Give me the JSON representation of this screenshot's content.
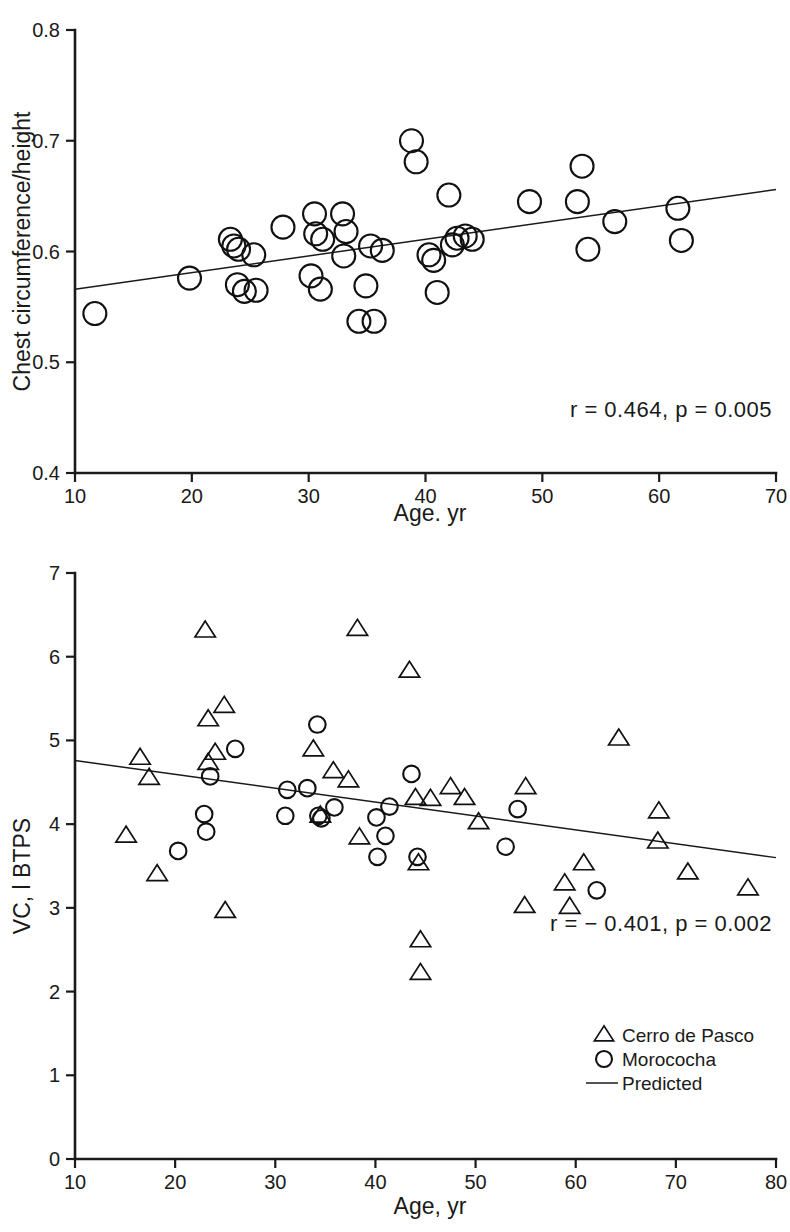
{
  "figure": {
    "background": "#ffffff",
    "ink_color": "#1a1a1a"
  },
  "chart_data": [
    {
      "id": "chest-circumference-vs-age",
      "type": "scatter",
      "title": "",
      "xlabel": "Age. yr",
      "ylabel": "Chest circumference/height",
      "xlim": [
        10,
        70
      ],
      "ylim": [
        0.4,
        0.8
      ],
      "xticks": [
        10,
        20,
        30,
        40,
        50,
        60,
        70
      ],
      "xtick_labels": [
        "10",
        "20",
        "30",
        "40",
        "50",
        "60",
        "70"
      ],
      "yticks": [
        0.4,
        0.5,
        0.6,
        0.7,
        0.8
      ],
      "ytick_labels": [
        "0.4",
        "0.5",
        "0.6",
        "0.7",
        "0.8"
      ],
      "grid": false,
      "legend": false,
      "annotation": "r  =  0.464,  p  =  0.005",
      "annotation_r": "0.464",
      "annotation_p": "0.005",
      "series": [
        {
          "name": "Subjects",
          "marker": "circle",
          "points": [
            [
              11.7,
              0.544
            ],
            [
              19.8,
              0.576
            ],
            [
              23.3,
              0.611
            ],
            [
              23.6,
              0.605
            ],
            [
              23.9,
              0.57
            ],
            [
              24.0,
              0.602
            ],
            [
              24.5,
              0.564
            ],
            [
              25.3,
              0.597
            ],
            [
              25.5,
              0.565
            ],
            [
              27.8,
              0.622
            ],
            [
              30.2,
              0.578
            ],
            [
              30.5,
              0.634
            ],
            [
              30.6,
              0.616
            ],
            [
              31.0,
              0.566
            ],
            [
              31.2,
              0.611
            ],
            [
              32.9,
              0.634
            ],
            [
              33.0,
              0.596
            ],
            [
              33.2,
              0.618
            ],
            [
              34.3,
              0.537
            ],
            [
              34.9,
              0.569
            ],
            [
              35.3,
              0.605
            ],
            [
              35.6,
              0.537
            ],
            [
              36.3,
              0.601
            ],
            [
              38.8,
              0.7
            ],
            [
              39.2,
              0.681
            ],
            [
              40.3,
              0.597
            ],
            [
              40.7,
              0.592
            ],
            [
              41.0,
              0.563
            ],
            [
              42.0,
              0.651
            ],
            [
              42.3,
              0.606
            ],
            [
              42.7,
              0.612
            ],
            [
              43.4,
              0.614
            ],
            [
              44.0,
              0.611
            ],
            [
              48.9,
              0.645
            ],
            [
              53.0,
              0.645
            ],
            [
              53.4,
              0.677
            ],
            [
              53.9,
              0.602
            ],
            [
              56.2,
              0.627
            ],
            [
              61.6,
              0.639
            ],
            [
              61.9,
              0.61
            ]
          ]
        }
      ],
      "fit_line": {
        "x0": 10,
        "y0": 0.566,
        "x1": 70,
        "y1": 0.656
      }
    },
    {
      "id": "vital-capacity-vs-age",
      "type": "scatter",
      "title": "",
      "xlabel": "Age, yr",
      "ylabel": "VC, l BTPS",
      "xlim": [
        10,
        80
      ],
      "ylim": [
        0,
        7
      ],
      "xticks": [
        10,
        20,
        30,
        40,
        50,
        60,
        70,
        80
      ],
      "xtick_labels": [
        "10",
        "20",
        "30",
        "40",
        "50",
        "60",
        "70",
        "80"
      ],
      "yticks": [
        0,
        1,
        2,
        3,
        4,
        5,
        6,
        7
      ],
      "ytick_labels": [
        "0",
        "1",
        "2",
        "3",
        "4",
        "5",
        "6",
        "7"
      ],
      "grid": false,
      "legend": true,
      "legend_position": "bottom-right",
      "annotation": "r  =  −  0.401,  p  =  0.002",
      "annotation_r": "- 0.401",
      "annotation_p": "0.002",
      "series": [
        {
          "name": "Cerro de Pasco",
          "marker": "triangle",
          "points": [
            [
              15.1,
              3.86
            ],
            [
              16.5,
              4.79
            ],
            [
              17.4,
              4.55
            ],
            [
              18.2,
              3.4
            ],
            [
              23.0,
              6.31
            ],
            [
              23.3,
              5.25
            ],
            [
              23.3,
              4.73
            ],
            [
              24.0,
              4.85
            ],
            [
              24.9,
              5.41
            ],
            [
              25.0,
              2.96
            ],
            [
              33.8,
              4.89
            ],
            [
              34.5,
              4.1
            ],
            [
              35.8,
              4.63
            ],
            [
              37.3,
              4.52
            ],
            [
              38.2,
              6.33
            ],
            [
              38.4,
              3.84
            ],
            [
              43.4,
              5.83
            ],
            [
              44.0,
              4.31
            ],
            [
              44.3,
              3.53
            ],
            [
              44.5,
              2.61
            ],
            [
              44.5,
              2.22
            ],
            [
              45.5,
              4.3
            ],
            [
              47.5,
              4.44
            ],
            [
              48.9,
              4.31
            ],
            [
              50.3,
              4.02
            ],
            [
              55.0,
              4.44
            ],
            [
              54.9,
              3.02
            ],
            [
              58.9,
              3.29
            ],
            [
              59.4,
              3.01
            ],
            [
              60.8,
              3.53
            ],
            [
              64.3,
              5.02
            ],
            [
              68.2,
              3.79
            ],
            [
              68.3,
              4.15
            ],
            [
              71.2,
              3.42
            ],
            [
              77.2,
              3.23
            ]
          ]
        },
        {
          "name": "Morococha",
          "marker": "circle",
          "points": [
            [
              20.3,
              3.68
            ],
            [
              22.9,
              4.12
            ],
            [
              23.1,
              3.91
            ],
            [
              23.5,
              4.57
            ],
            [
              26.0,
              4.9
            ],
            [
              31.0,
              4.1
            ],
            [
              31.2,
              4.41
            ],
            [
              33.2,
              4.43
            ],
            [
              34.2,
              5.19
            ],
            [
              34.3,
              4.1
            ],
            [
              34.6,
              4.07
            ],
            [
              35.9,
              4.2
            ],
            [
              40.1,
              4.08
            ],
            [
              40.2,
              3.61
            ],
            [
              41.0,
              3.86
            ],
            [
              41.4,
              4.21
            ],
            [
              43.6,
              4.6
            ],
            [
              44.2,
              3.61
            ],
            [
              53.0,
              3.73
            ],
            [
              54.2,
              4.18
            ],
            [
              62.1,
              3.21
            ]
          ]
        }
      ],
      "legend_entries": [
        {
          "marker": "triangle",
          "label": "Cerro de Pasco"
        },
        {
          "marker": "circle",
          "label": "Morococha"
        },
        {
          "marker": "line",
          "label": "Predicted"
        }
      ],
      "fit_line": {
        "x0": 10,
        "y0": 4.76,
        "x1": 80,
        "y1": 3.6
      }
    }
  ]
}
